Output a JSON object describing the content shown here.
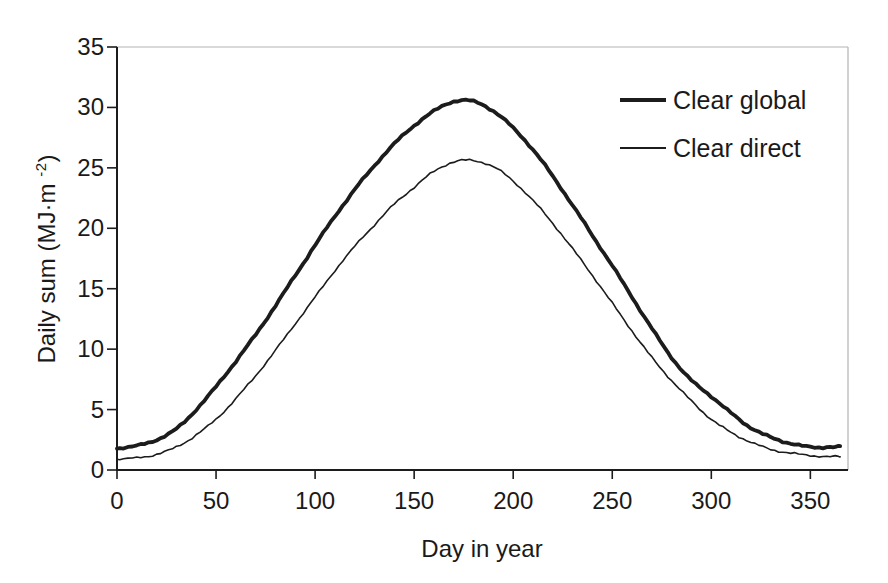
{
  "figure": {
    "background": "#ffffff",
    "axis_color": "#1c1c1c",
    "frame_light_color": "#b3b3b3",
    "curve_color": "#1c1c1c",
    "text_color": "#1a1a1a"
  },
  "chart_data": {
    "type": "line",
    "title": "",
    "xlabel": "Day in year",
    "ylabel": "Daily sum (MJ·m⁻²)",
    "ylabel_parts": {
      "prefix": "Daily sum (MJ·m ",
      "superscript": "-2",
      "suffix": ")"
    },
    "xlim": [
      0,
      369
    ],
    "ylim": [
      0,
      35
    ],
    "x_ticks": [
      0,
      50,
      100,
      150,
      200,
      250,
      300,
      350
    ],
    "y_ticks": [
      0,
      5,
      10,
      15,
      20,
      25,
      30,
      35
    ],
    "grid": false,
    "legend_position": "upper-right-inside",
    "x": [
      0,
      10,
      20,
      30,
      40,
      50,
      60,
      70,
      80,
      90,
      100,
      110,
      120,
      130,
      140,
      150,
      160,
      170,
      180,
      190,
      200,
      210,
      220,
      230,
      240,
      250,
      260,
      270,
      280,
      290,
      300,
      310,
      320,
      330,
      340,
      350,
      360,
      365
    ],
    "series": [
      {
        "name": "Clear global",
        "style": "thick",
        "values": [
          1.8,
          2.0,
          2.5,
          3.4,
          5.0,
          6.9,
          9.0,
          11.2,
          13.6,
          16.1,
          18.6,
          21.0,
          23.2,
          25.2,
          27.0,
          28.5,
          29.7,
          30.5,
          30.5,
          29.7,
          28.3,
          26.5,
          24.3,
          21.9,
          19.4,
          16.9,
          14.3,
          11.7,
          9.3,
          7.4,
          6.1,
          4.7,
          3.5,
          2.7,
          2.2,
          1.9,
          1.9,
          1.9
        ]
      },
      {
        "name": "Clear direct",
        "style": "thin",
        "values": [
          0.9,
          1.0,
          1.3,
          1.9,
          2.9,
          4.2,
          5.9,
          7.8,
          9.9,
          12.1,
          14.3,
          16.5,
          18.5,
          20.3,
          22.0,
          23.4,
          24.7,
          25.5,
          25.6,
          25.1,
          23.9,
          22.3,
          20.4,
          18.3,
          16.1,
          13.8,
          11.5,
          9.3,
          7.4,
          5.7,
          4.2,
          3.1,
          2.3,
          1.7,
          1.4,
          1.2,
          1.1,
          1.1
        ]
      }
    ]
  }
}
